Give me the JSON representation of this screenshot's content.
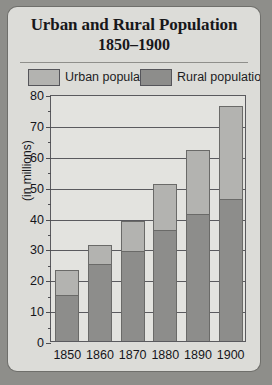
{
  "card": {
    "title_line_1": "Urban and Rural Population",
    "title_line_2": "1850–1900"
  },
  "legend": {
    "urban": {
      "label": "Urban population",
      "color": "#b3b3b0",
      "swatch_icon": "legend-swatch-icon"
    },
    "rural": {
      "label": "Rural population",
      "color": "#8d8d8b",
      "swatch_icon": "legend-swatch-icon"
    }
  },
  "chart_data": {
    "type": "bar",
    "title": "Urban and Rural Population 1850–1900",
    "subtitle": "1850–1900",
    "stacked": true,
    "xlabel": "",
    "ylabel": "(in millions)",
    "ylim": [
      0,
      80
    ],
    "ytick_step": 10,
    "yticks": [
      0,
      10,
      20,
      30,
      40,
      50,
      60,
      70,
      80
    ],
    "ytick_labels": [
      "0",
      "10",
      "20",
      "30",
      "40",
      "50",
      "60",
      "70",
      "80"
    ],
    "grid": true,
    "legend_position": "top",
    "categories": [
      "1850",
      "1860",
      "1870",
      "1880",
      "1890",
      "1900"
    ],
    "series": [
      {
        "name": "Rural population",
        "color": "#8d8d8b",
        "values": [
          15,
          25,
          29,
          36,
          41,
          46
        ]
      },
      {
        "name": "Urban population",
        "color": "#b3b3b0",
        "values": [
          8,
          6,
          10,
          15,
          21,
          30
        ]
      }
    ],
    "totals": [
      23,
      31,
      39,
      51,
      62,
      76
    ]
  }
}
